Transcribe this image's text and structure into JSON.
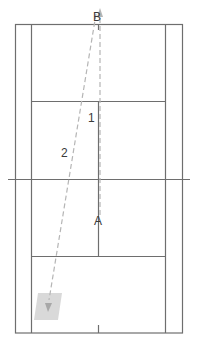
{
  "diagram": {
    "colors": {
      "court_line": "#6e6e6e",
      "path_line": "#b5b5b5",
      "target_fill": "#d9d9d9",
      "label": "#3a3a3a"
    },
    "points": {
      "a_label": "A",
      "b_label": "B"
    },
    "paths": [
      {
        "label": "1",
        "from": "A",
        "to": "B",
        "style": "dashed"
      },
      {
        "label": "2",
        "from": "B",
        "to": "target-zone",
        "style": "dashed"
      }
    ],
    "target_zone": "shaded target area near left singles sideline"
  }
}
